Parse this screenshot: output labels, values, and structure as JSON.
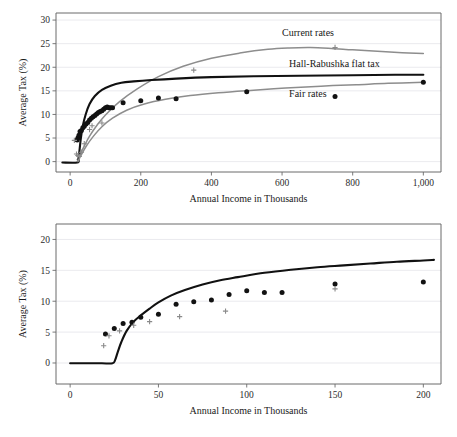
{
  "figure": {
    "title": "",
    "background": "#ffffff"
  },
  "colors": {
    "dark_curve": "#111111",
    "gray_curve": "#8d8d8d",
    "dot_marker": "#121212",
    "plus_marker": "#8a8a8a",
    "grid": "#e4e4ea",
    "axis": "#6b6b6b"
  },
  "panels": {
    "top": {
      "name": "top-panel",
      "xlabel": "Annual Income in Thousands",
      "ylabel": "Average Tax (%)",
      "xlim": [
        -40,
        1050
      ],
      "ylim": [
        -2.2,
        31.5
      ],
      "xticks": [
        0,
        200,
        400,
        600,
        800,
        1000
      ],
      "xticklabels": [
        "0",
        "200",
        "400",
        "600",
        "800",
        "1,000"
      ],
      "yticks": [
        0,
        5,
        10,
        15,
        20,
        25,
        30
      ],
      "yticklabels": [
        "0",
        "5",
        "10",
        "15",
        "20",
        "25",
        "30"
      ],
      "annotations": [
        {
          "text": "Current rates",
          "x": 600,
          "y": 26.7
        },
        {
          "text": "Hall-Rabushka flat tax",
          "x": 620,
          "y": 20.1
        },
        {
          "text": "Fair rates",
          "x": 620,
          "y": 13.6
        }
      ]
    },
    "bottom": {
      "name": "bottom-panel",
      "xlabel": "Annual Income in Thousands",
      "ylabel": "Average Tax (%)",
      "xlim": [
        -8,
        210
      ],
      "ylim": [
        -3.4,
        22.5
      ],
      "xticks": [
        0,
        50,
        100,
        150,
        200
      ],
      "xticklabels": [
        "0",
        "50",
        "100",
        "150",
        "200"
      ],
      "yticks": [
        0,
        5,
        10,
        15,
        20
      ],
      "yticklabels": [
        "0",
        "5",
        "10",
        "15",
        "20"
      ],
      "annotations": []
    }
  },
  "chart_data": [
    {
      "type": "line",
      "name": "top-chart",
      "title": "",
      "xlabel": "Annual Income in Thousands",
      "ylabel": "Average Tax (%)",
      "xlim": [
        -40,
        1050
      ],
      "ylim": [
        -2.2,
        31.5
      ],
      "grid": true,
      "legend": "inline-annotations",
      "series": [
        {
          "name": "Current rates",
          "style": "line",
          "color": "#8d8d8d",
          "x": [
            20,
            25,
            30,
            40,
            55,
            75,
            100,
            140,
            190,
            250,
            320,
            400,
            480,
            560,
            620,
            680,
            740,
            800,
            870,
            940,
            1000
          ],
          "y": [
            0.4,
            1.0,
            1.8,
            3.3,
            5.4,
            7.6,
            9.9,
            12.7,
            15.4,
            18.0,
            20.2,
            21.9,
            23.0,
            23.8,
            24.1,
            24.2,
            24.0,
            23.7,
            23.4,
            23.1,
            22.9
          ]
        },
        {
          "name": "Hall-Rabushka flat tax",
          "style": "line",
          "color": "#111111",
          "x": [
            -22,
            20,
            24,
            26,
            30,
            36,
            44,
            55,
            70,
            90,
            115,
            145,
            180,
            230,
            300,
            400,
            520,
            650,
            800,
            920,
            1000
          ],
          "y": [
            -0.2,
            -0.2,
            0.6,
            2.0,
            4.7,
            7.6,
            10.0,
            12.2,
            13.9,
            15.2,
            16.1,
            16.7,
            17.0,
            17.3,
            17.6,
            17.9,
            18.1,
            18.2,
            18.3,
            18.4,
            18.4
          ]
        },
        {
          "name": "Fair rates",
          "style": "line",
          "color": "#8d8d8d",
          "x": [
            22,
            30,
            45,
            65,
            90,
            120,
            160,
            210,
            270,
            340,
            420,
            510,
            610,
            710,
            810,
            900,
            1000
          ],
          "y": [
            0.0,
            1.2,
            3.2,
            5.3,
            7.4,
            9.2,
            10.9,
            12.2,
            13.2,
            14.0,
            14.6,
            15.1,
            15.6,
            16.0,
            16.3,
            16.6,
            16.8
          ]
        },
        {
          "name": "Fair rates data points",
          "style": "scatter-dot",
          "color": "#121212",
          "x": [
            20,
            22,
            25,
            28,
            32,
            36,
            40,
            45,
            50,
            55,
            60,
            65,
            70,
            75,
            80,
            85,
            90,
            95,
            100,
            105,
            110,
            115,
            120,
            150,
            200,
            250,
            300,
            500,
            750,
            1000
          ],
          "y": [
            4.6,
            5.0,
            5.6,
            6.4,
            6.6,
            7.2,
            7.5,
            8.0,
            8.3,
            8.8,
            9.2,
            9.5,
            9.8,
            10.1,
            10.4,
            10.6,
            10.8,
            11.1,
            11.4,
            11.6,
            11.4,
            11.4,
            11.4,
            12.5,
            12.9,
            13.5,
            13.3,
            14.8,
            13.8,
            16.8
          ]
        },
        {
          "name": "Current rates data points",
          "style": "scatter-plus",
          "color": "#8a8a8a",
          "x": [
            12,
            18,
            22,
            26,
            32,
            40,
            55,
            62,
            90,
            350,
            750
          ],
          "y": [
            4.5,
            1.6,
            1.3,
            1.1,
            2.0,
            3.8,
            6.8,
            7.6,
            8.2,
            19.4,
            24.2
          ]
        }
      ]
    },
    {
      "type": "line",
      "name": "bottom-chart",
      "title": "",
      "xlabel": "Annual Income in Thousands",
      "ylabel": "Average Tax (%)",
      "xlim": [
        -8,
        210
      ],
      "ylim": [
        -3.4,
        22.5
      ],
      "grid": true,
      "legend": "none",
      "series": [
        {
          "name": "Hall-Rabushka flat tax",
          "style": "line",
          "color": "#111111",
          "x": [
            0,
            10,
            18,
            24,
            25.5,
            27,
            29,
            32,
            36,
            40,
            45,
            50,
            57,
            65,
            75,
            85,
            95,
            110,
            125,
            140,
            155,
            170,
            185,
            200,
            206
          ],
          "y": [
            -0.05,
            -0.05,
            -0.05,
            -0.05,
            0.5,
            1.8,
            3.4,
            5.2,
            6.7,
            7.7,
            8.8,
            9.8,
            10.9,
            11.8,
            12.7,
            13.4,
            13.9,
            14.6,
            15.1,
            15.5,
            15.8,
            16.1,
            16.4,
            16.6,
            16.7
          ]
        },
        {
          "name": "Fair rates data points",
          "style": "scatter-dot",
          "color": "#121212",
          "x": [
            20,
            25,
            30,
            35,
            40,
            50,
            60,
            70,
            80,
            90,
            100,
            110,
            120,
            150,
            200
          ],
          "y": [
            4.7,
            5.6,
            6.4,
            6.6,
            7.4,
            7.9,
            9.5,
            9.9,
            10.2,
            11.1,
            11.7,
            11.4,
            11.4,
            12.8,
            13.1
          ]
        },
        {
          "name": "Current rates data points",
          "style": "scatter-plus",
          "color": "#8a8a8a",
          "x": [
            19,
            22,
            28,
            36,
            45,
            62,
            88,
            150
          ],
          "y": [
            2.8,
            4.4,
            5.2,
            6.1,
            6.7,
            7.5,
            8.4,
            12.0
          ]
        }
      ]
    }
  ]
}
